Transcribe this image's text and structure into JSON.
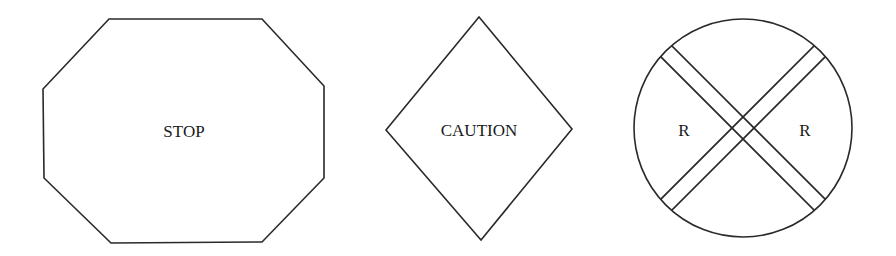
{
  "figure": {
    "signs": [
      {
        "shape": "octagon",
        "label": "STOP"
      },
      {
        "shape": "diamond",
        "label": "CAUTION"
      },
      {
        "shape": "circle-crossbuck",
        "labels": [
          "R",
          "R"
        ]
      }
    ]
  }
}
